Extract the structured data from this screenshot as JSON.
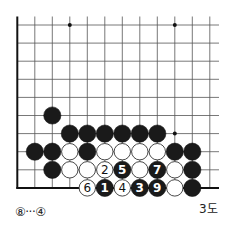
{
  "diagram": {
    "label": "3도",
    "note": "⑧···④",
    "grid": {
      "cols": 12,
      "rows": 10,
      "origin_x": 17.3,
      "origin_y": 25,
      "dx": 17.5,
      "dy": 18.1,
      "right_extent": 219,
      "top_extent": 16.5,
      "line_color": "#555555",
      "edge_color": "#111111"
    },
    "star_points": [
      {
        "col": 3,
        "row": 0
      },
      {
        "col": 9,
        "row": 0
      },
      {
        "col": 9,
        "row": 6
      }
    ],
    "stones": [
      {
        "color": "black",
        "col": 2,
        "row": 5,
        "label": ""
      },
      {
        "color": "black",
        "col": 3,
        "row": 6,
        "label": ""
      },
      {
        "color": "black",
        "col": 4,
        "row": 6,
        "label": ""
      },
      {
        "color": "black",
        "col": 5,
        "row": 6,
        "label": ""
      },
      {
        "color": "black",
        "col": 6,
        "row": 6,
        "label": ""
      },
      {
        "color": "black",
        "col": 7,
        "row": 6,
        "label": ""
      },
      {
        "color": "black",
        "col": 8,
        "row": 6,
        "label": ""
      },
      {
        "color": "black",
        "col": 1,
        "row": 7,
        "label": ""
      },
      {
        "color": "black",
        "col": 2,
        "row": 7,
        "label": ""
      },
      {
        "color": "white",
        "col": 3,
        "row": 7,
        "label": ""
      },
      {
        "color": "black",
        "col": 4,
        "row": 7,
        "label": ""
      },
      {
        "color": "white",
        "col": 5,
        "row": 7,
        "label": ""
      },
      {
        "color": "white",
        "col": 6,
        "row": 7,
        "label": ""
      },
      {
        "color": "white",
        "col": 7,
        "row": 7,
        "label": ""
      },
      {
        "color": "white",
        "col": 8,
        "row": 7,
        "label": ""
      },
      {
        "color": "black",
        "col": 9,
        "row": 7,
        "label": ""
      },
      {
        "color": "black",
        "col": 10,
        "row": 7,
        "label": ""
      },
      {
        "color": "black",
        "col": 2,
        "row": 8,
        "label": ""
      },
      {
        "color": "white",
        "col": 3,
        "row": 8,
        "label": ""
      },
      {
        "color": "white",
        "col": 4,
        "row": 8,
        "label": ""
      },
      {
        "color": "white",
        "col": 5,
        "row": 8,
        "label": "2"
      },
      {
        "color": "black",
        "col": 6,
        "row": 8,
        "label": "5"
      },
      {
        "color": "white",
        "col": 7,
        "row": 8,
        "label": ""
      },
      {
        "color": "black",
        "col": 8,
        "row": 8,
        "label": "7"
      },
      {
        "color": "white",
        "col": 9,
        "row": 8,
        "label": ""
      },
      {
        "color": "black",
        "col": 10,
        "row": 8,
        "label": ""
      },
      {
        "color": "white",
        "col": 4,
        "row": 9,
        "label": "6"
      },
      {
        "color": "black",
        "col": 5,
        "row": 9,
        "label": "1"
      },
      {
        "color": "white",
        "col": 6,
        "row": 9,
        "label": "4"
      },
      {
        "color": "black",
        "col": 7,
        "row": 9,
        "label": "3"
      },
      {
        "color": "black",
        "col": 8,
        "row": 9,
        "label": "9"
      },
      {
        "color": "white",
        "col": 9,
        "row": 9,
        "label": ""
      },
      {
        "color": "black",
        "col": 10,
        "row": 9,
        "label": ""
      }
    ]
  }
}
